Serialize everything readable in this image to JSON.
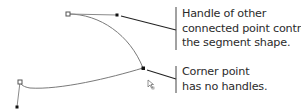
{
  "diagram": {
    "type": "bezier-path-anatomy",
    "colors": {
      "path": "#7a7a7a",
      "handle": "#8a8a8a",
      "leader": "#222222",
      "text": "#2b2b2b"
    },
    "points": [
      {
        "id": "top-anchor",
        "style": "hollow",
        "x": 68,
        "y": 14
      },
      {
        "id": "top-handle-end",
        "style": "filled",
        "x": 117,
        "y": 15
      },
      {
        "id": "corner-point",
        "style": "filled",
        "x": 143,
        "y": 68
      },
      {
        "id": "left-anchor",
        "style": "hollow",
        "x": 20,
        "y": 82
      },
      {
        "id": "left-handle-end",
        "style": "filled",
        "x": 17,
        "y": 107
      }
    ],
    "cursor_icon": "direct-selection-cursor",
    "callouts": [
      {
        "id": "handle-callout",
        "lines": [
          "Handle of other",
          "connected point controls",
          "the segment shape."
        ]
      },
      {
        "id": "corner-callout",
        "lines": [
          "Corner point",
          "has no handles."
        ]
      }
    ]
  }
}
